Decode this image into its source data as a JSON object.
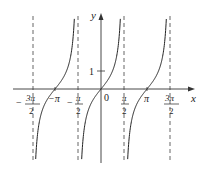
{
  "chart_data": {
    "type": "line",
    "function": "y = tan(x)",
    "title": "",
    "xlabel": "x",
    "ylabel": "y",
    "x_ticks": [
      {
        "value": -4.712,
        "label": "-3π/2"
      },
      {
        "value": -3.1416,
        "label": "-π"
      },
      {
        "value": -1.5708,
        "label": "-π/2"
      },
      {
        "value": 0,
        "label": "0"
      },
      {
        "value": 1.5708,
        "label": "π/2"
      },
      {
        "value": 3.1416,
        "label": "π"
      },
      {
        "value": 4.712,
        "label": "3π/2"
      }
    ],
    "y_ticks": [
      {
        "value": 1,
        "label": "1"
      }
    ],
    "asymptotes_x": [
      -4.712,
      -1.5708,
      1.5708,
      4.712
    ],
    "asymptote_style": "dashed",
    "branches": [
      {
        "from": -4.712,
        "to": -1.5708,
        "zero_at": -3.1416
      },
      {
        "from": -1.5708,
        "to": 1.5708,
        "zero_at": 0
      },
      {
        "from": 1.5708,
        "to": 4.712,
        "zero_at": 3.1416
      }
    ],
    "grid": false,
    "legend": null
  },
  "labels": {
    "x_axis": "x",
    "y_axis": "y",
    "origin": "0",
    "y_one": "1",
    "neg_pi": "−π",
    "pi": "π",
    "pi_sym": "π",
    "two": "2",
    "three_pi": "3π",
    "minus": "−"
  },
  "colors": {
    "curve": "#222222",
    "axis": "#333333",
    "asymptote": "#555555"
  }
}
